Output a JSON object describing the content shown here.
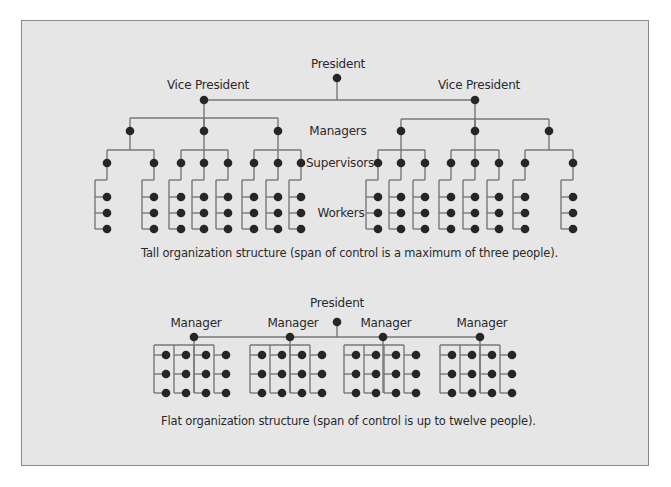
{
  "colors": {
    "background": "#e6e6e6",
    "border": "#8a8a8a",
    "line": "#777777",
    "node": "#262626",
    "text": "#2a2a2a"
  },
  "tall_structure": {
    "labels": {
      "president": "President",
      "vice_president_left": "Vice President",
      "vice_president_right": "Vice President",
      "managers": "Managers",
      "supervisors": "Supervisors",
      "workers": "Workers"
    },
    "caption": "Tall organization structure (span of control is a maximum of three people).",
    "president": {
      "x": 337,
      "y": 78
    },
    "vp_bar_y": 100,
    "vice_presidents": [
      {
        "x": 204,
        "y": 100,
        "manager_bar_y": 118,
        "managers": [
          {
            "x": 130,
            "supervisors": [
              107,
              154
            ]
          },
          {
            "x": 204,
            "supervisors": [
              181,
              204,
              228
            ]
          },
          {
            "x": 278,
            "supervisors": [
              254,
              278,
              301
            ]
          }
        ]
      },
      {
        "x": 475,
        "y": 100,
        "manager_bar_y": 119,
        "managers": [
          {
            "x": 401,
            "supervisors": [
              378,
              401,
              425
            ]
          },
          {
            "x": 475,
            "supervisors": [
              451,
              475,
              499
            ]
          },
          {
            "x": 549,
            "supervisors": [
              525,
              573
            ]
          }
        ]
      }
    ],
    "manager_y": 131,
    "supervisor_bar_offset": 13,
    "supervisor_y": 163,
    "worker_rows": [
      197,
      213,
      229
    ],
    "worker_count_per_supervisor": 3
  },
  "flat_structure": {
    "labels": {
      "president": "President",
      "managers": [
        "Manager",
        "Manager",
        "Manager",
        "Manager"
      ]
    },
    "caption": "Flat organization structure (span of control is up to twelve people).",
    "president": {
      "x": 337,
      "y": 322
    },
    "bar_y": 337,
    "managers": [
      {
        "x": 194,
        "worker_cols": [
          166,
          186,
          206,
          226
        ]
      },
      {
        "x": 290,
        "worker_cols": [
          262,
          282,
          302,
          322
        ]
      },
      {
        "x": 383,
        "worker_cols": [
          356,
          376,
          396,
          416
        ]
      },
      {
        "x": 480,
        "worker_cols": [
          452,
          472,
          492,
          512
        ]
      }
    ],
    "worker_rows": [
      355,
      374,
      393
    ],
    "workers_per_manager": 12
  }
}
